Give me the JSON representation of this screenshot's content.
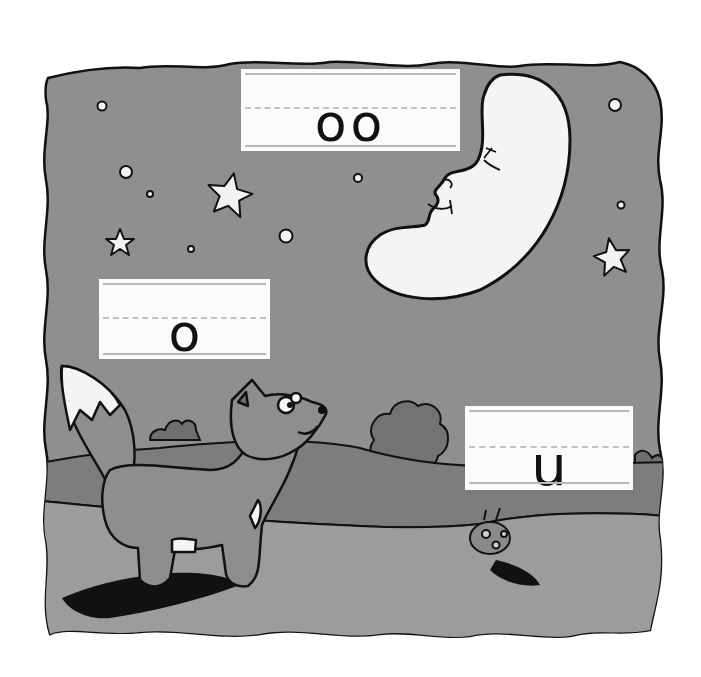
{
  "scene": {
    "description": "Night scene with a fox looking up at a crescent moon; handwriting practice cards",
    "colors": {
      "sky": "#8f8f8f",
      "hills": "#7d7d7d",
      "ground": "#9c9c9c",
      "moon": "#f4f4f4",
      "outline": "#111111",
      "card": "#fbfbfb",
      "page": "#ffffff"
    }
  },
  "cards": [
    {
      "id": "moon-card",
      "letters": "oo"
    },
    {
      "id": "fox-card",
      "letters": "o"
    },
    {
      "id": "bug-card",
      "letters": "u"
    }
  ],
  "characters": {
    "moon": "crescent-moon-face",
    "fox": "fox",
    "bug": "ladybug"
  }
}
